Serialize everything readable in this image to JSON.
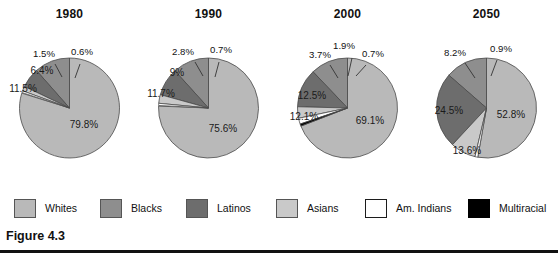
{
  "figure": {
    "caption": "Figure 4.3"
  },
  "legend": {
    "items": [
      {
        "label": "Whites",
        "color": "#b9b9b9"
      },
      {
        "label": "Blacks",
        "color": "#8e8e8e"
      },
      {
        "label": "Latinos",
        "color": "#6d6d6d"
      },
      {
        "label": "Asians",
        "color": "#c9c9c9"
      },
      {
        "label": "Am. Indians",
        "color": "#ffffff"
      },
      {
        "label": "Multiracial",
        "color": "#000000"
      }
    ]
  },
  "chart_data": {
    "type": "pie",
    "title": "Figure 4.3",
    "legend_position": "bottom",
    "categories": [
      "Whites",
      "Blacks",
      "Latinos",
      "Asians",
      "Am. Indians",
      "Multiracial"
    ],
    "colors": [
      "#b9b9b9",
      "#8e8e8e",
      "#6d6d6d",
      "#c9c9c9",
      "#ffffff",
      "#000000"
    ],
    "charts": [
      {
        "title": "1980",
        "labels": [
          "79.8%",
          "11.5%",
          "6.4%",
          "1.5%",
          "0.6%"
        ],
        "slices": [
          {
            "name": "Whites",
            "value": 79.8,
            "label": "79.8%"
          },
          {
            "name": "Blacks",
            "value": 11.5,
            "label": "11.5%"
          },
          {
            "name": "Latinos",
            "value": 6.4,
            "label": "6.4%"
          },
          {
            "name": "Asians",
            "value": 1.5,
            "label": "1.5%"
          },
          {
            "name": "Am. Indians",
            "value": 0.6,
            "label": "0.6%"
          }
        ]
      },
      {
        "title": "1990",
        "labels": [
          "75.6%",
          "11.7%",
          "9%",
          "2.8%",
          "0.7%"
        ],
        "slices": [
          {
            "name": "Whites",
            "value": 75.6,
            "label": "75.6%"
          },
          {
            "name": "Blacks",
            "value": 11.7,
            "label": "11.7%"
          },
          {
            "name": "Latinos",
            "value": 9.0,
            "label": "9%"
          },
          {
            "name": "Asians",
            "value": 2.8,
            "label": "2.8%"
          },
          {
            "name": "Am. Indians",
            "value": 0.7,
            "label": "0.7%"
          }
        ]
      },
      {
        "title": "2000",
        "labels": [
          "69.1%",
          "12.1%",
          "12.5%",
          "3.7%",
          "1.9%",
          "0.7%"
        ],
        "slices": [
          {
            "name": "Whites",
            "value": 69.1,
            "label": "69.1%"
          },
          {
            "name": "Blacks",
            "value": 12.1,
            "label": "12.1%"
          },
          {
            "name": "Latinos",
            "value": 12.5,
            "label": "12.5%"
          },
          {
            "name": "Asians",
            "value": 3.7,
            "label": "3.7%"
          },
          {
            "name": "Am. Indians",
            "value": 1.9,
            "label": "1.9%"
          },
          {
            "name": "Multiracial",
            "value": 0.7,
            "label": "0.7%"
          }
        ]
      },
      {
        "title": "2050",
        "labels": [
          "52.8%",
          "13.6%",
          "24.5%",
          "8.2%",
          "0.9%"
        ],
        "slices": [
          {
            "name": "Whites",
            "value": 52.8,
            "label": "52.8%"
          },
          {
            "name": "Blacks",
            "value": 13.6,
            "label": "13.6%"
          },
          {
            "name": "Latinos",
            "value": 24.5,
            "label": "24.5%"
          },
          {
            "name": "Asians",
            "value": 8.2,
            "label": "8.2%"
          },
          {
            "name": "Am. Indians",
            "value": 0.9,
            "label": "0.9%"
          }
        ]
      }
    ]
  }
}
